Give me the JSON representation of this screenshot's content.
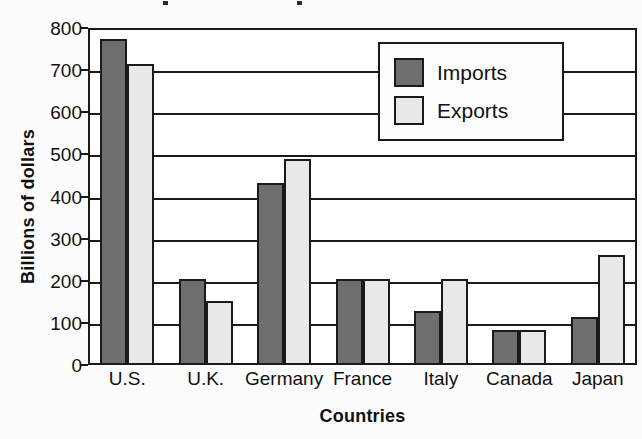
{
  "chart_data": {
    "type": "bar",
    "title": "",
    "xlabel": "Countries",
    "ylabel": "Billions of dollars",
    "categories": [
      "U.S.",
      "U.K.",
      "Germany",
      "France",
      "Italy",
      "Canada",
      "Japan"
    ],
    "series": [
      {
        "name": "Imports",
        "color": "#6e6e6e",
        "values": [
          775,
          205,
          432,
          205,
          128,
          83,
          115
        ]
      },
      {
        "name": "Exports",
        "color": "#e8e8e8",
        "values": [
          715,
          152,
          490,
          205,
          205,
          83,
          262
        ]
      }
    ],
    "ylim": [
      0,
      800
    ],
    "yticks": [
      0,
      100,
      200,
      300,
      400,
      500,
      600,
      700,
      800
    ],
    "ytick_labels": [
      "0",
      "100",
      "200",
      "300",
      "400",
      "500",
      "600",
      "700",
      "800"
    ],
    "grid": true,
    "legend_position": "top-right",
    "legend_entries": [
      "Imports",
      "Exports"
    ]
  },
  "legend": {
    "imports_label": "Imports",
    "exports_label": "Exports"
  },
  "axes": {
    "y_title": "Billions of dollars",
    "x_title": "Countries"
  }
}
